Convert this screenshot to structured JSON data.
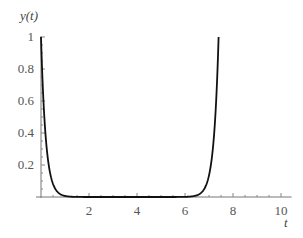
{
  "chart_data": {
    "type": "line",
    "title": "",
    "xlabel": "t",
    "ylabel": "y(t)",
    "xlim": [
      0,
      10.4
    ],
    "ylim": [
      0,
      1
    ],
    "x_ticks": [
      2,
      4,
      6,
      8,
      10
    ],
    "x_tick_labels": [
      "2",
      "4",
      "6",
      "8",
      "10"
    ],
    "y_ticks": [
      0.2,
      0.4,
      0.6,
      0.8,
      1
    ],
    "y_tick_labels": [
      "0.2",
      "0.4",
      "0.6",
      "0.8",
      "1"
    ],
    "grid": false,
    "legend": null,
    "series": [
      {
        "name": "y(t)",
        "color": "#111111",
        "x": [
          0,
          0.1,
          0.2,
          0.3,
          0.4,
          0.5,
          0.6,
          0.8,
          1.0,
          1.2,
          1.5,
          2,
          3,
          4,
          5,
          6,
          6.4,
          6.6,
          6.8,
          7.0,
          7.1,
          7.2,
          7.3,
          7.4
        ],
        "values": [
          1.0,
          0.61,
          0.37,
          0.22,
          0.14,
          0.08,
          0.05,
          0.018,
          0.007,
          0.002,
          0.001,
          0,
          0,
          0,
          0,
          0.001,
          0.007,
          0.018,
          0.05,
          0.14,
          0.22,
          0.37,
          0.61,
          1.0
        ]
      }
    ]
  }
}
